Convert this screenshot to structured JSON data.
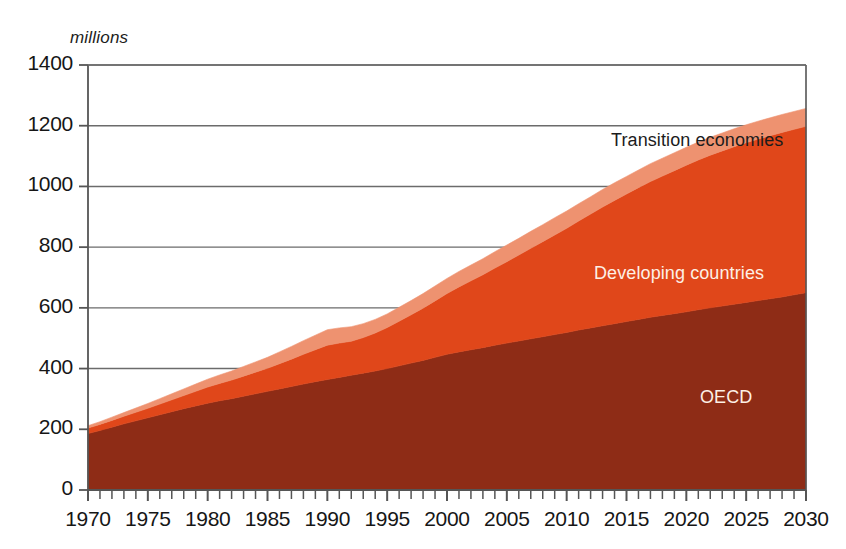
{
  "chart_data": {
    "type": "area",
    "stacked": true,
    "title": "",
    "subtitle": "",
    "unit_label": "millions",
    "xlabel": "",
    "ylabel": "millions",
    "xlim": [
      1970,
      2030
    ],
    "ylim": [
      0,
      1400
    ],
    "yticks": [
      0,
      200,
      400,
      600,
      800,
      1000,
      1200,
      1400
    ],
    "ytick_labels": [
      "0",
      "200",
      "400",
      "600",
      "800",
      "1000",
      "1200",
      "1400"
    ],
    "xticks": [
      1970,
      1975,
      1980,
      1985,
      1990,
      1995,
      2000,
      2005,
      2010,
      2015,
      2020,
      2025,
      2030
    ],
    "xtick_labels": [
      "1970",
      "1975",
      "1980",
      "1985",
      "1990",
      "1995",
      "2000",
      "2005",
      "2010",
      "2015",
      "2020",
      "2025",
      "2030"
    ],
    "x_minor_tick_interval": 1,
    "grid": "horizontal",
    "legend_position": "inline-annotations",
    "x": [
      1970,
      1971,
      1972,
      1973,
      1974,
      1975,
      1976,
      1977,
      1978,
      1979,
      1980,
      1981,
      1982,
      1983,
      1984,
      1985,
      1986,
      1987,
      1988,
      1989,
      1990,
      1991,
      1992,
      1993,
      1994,
      1995,
      1996,
      1997,
      1998,
      1999,
      2000,
      2001,
      2002,
      2003,
      2004,
      2005,
      2006,
      2007,
      2008,
      2009,
      2010,
      2011,
      2012,
      2013,
      2014,
      2015,
      2016,
      2017,
      2018,
      2019,
      2020,
      2021,
      2022,
      2023,
      2024,
      2025,
      2026,
      2027,
      2028,
      2029,
      2030
    ],
    "series": [
      {
        "name": "OECD",
        "color": "#8E2C16",
        "label_color": "#fdf0e6",
        "values": [
          186,
          196,
          207,
          218,
          228,
          238,
          248,
          258,
          268,
          277,
          286,
          294,
          301,
          309,
          317,
          325,
          333,
          341,
          349,
          357,
          364,
          371,
          378,
          385,
          392,
          400,
          409,
          418,
          427,
          437,
          447,
          455,
          462,
          469,
          477,
          484,
          491,
          498,
          505,
          512,
          519,
          527,
          534,
          541,
          548,
          555,
          562,
          569,
          575,
          581,
          587,
          594,
          600,
          606,
          612,
          618,
          624,
          630,
          636,
          643,
          650
        ]
      },
      {
        "name": "Developing countries",
        "color": "#E0471A",
        "label_color": "#fdf0e6",
        "values": [
          18,
          20,
          22,
          25,
          28,
          31,
          35,
          39,
          43,
          48,
          53,
          57,
          61,
          66,
          71,
          76,
          83,
          90,
          98,
          105,
          113,
          113,
          112,
          117,
          125,
          135,
          147,
          159,
          172,
          186,
          200,
          214,
          227,
          240,
          254,
          268,
          283,
          298,
          313,
          328,
          343,
          359,
          375,
          391,
          406,
          420,
          434,
          447,
          459,
          471,
          483,
          493,
          503,
          511,
          519,
          526,
          532,
          537,
          542,
          545,
          548
        ]
      },
      {
        "name": "Transition economies",
        "color": "#EE9270",
        "label_color": "#1c1c1c",
        "values": [
          8,
          9,
          11,
          12,
          14,
          16,
          18,
          20,
          22,
          24,
          26,
          28,
          30,
          32,
          34,
          36,
          39,
          42,
          45,
          48,
          51,
          50,
          48,
          46,
          45,
          45,
          46,
          47,
          48,
          49,
          50,
          51,
          52,
          53,
          54,
          55,
          55,
          56,
          56,
          57,
          57,
          57,
          57,
          58,
          58,
          58,
          58,
          59,
          59,
          59,
          59,
          59,
          59,
          59,
          59,
          59,
          59,
          59,
          59,
          59,
          59
        ]
      }
    ],
    "annotations": [
      {
        "text": "Transition economies",
        "series": "Transition economies",
        "x_px": 611,
        "y_px": 130
      },
      {
        "text": "Developing countries",
        "series": "Developing countries",
        "x_px": 594,
        "y_px": 263
      },
      {
        "text": "OECD",
        "series": "OECD",
        "x_px": 700,
        "y_px": 387
      }
    ],
    "axis_color": "#555555",
    "gridline_color": "#6b6b6b",
    "background": "#ffffff"
  }
}
